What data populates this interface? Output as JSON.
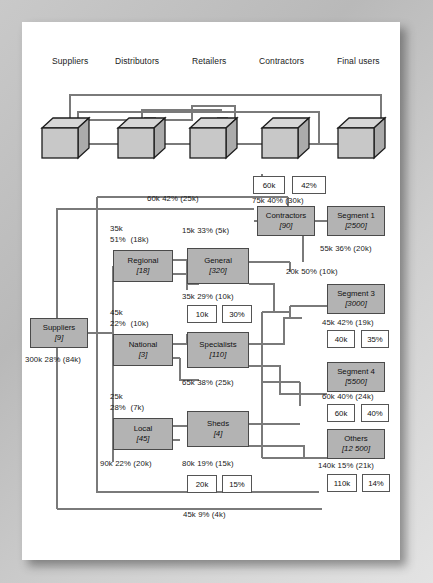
{
  "diagram": {
    "colors": {
      "node_fill": "#b3b3b3",
      "node_stroke": "#4a4a4a",
      "line": "#7a7a7a",
      "page_bg": "#ffffff",
      "outer_bg": "#c4c4c4"
    },
    "chain_labels": [
      {
        "id": "suppliers",
        "text": "Suppliers",
        "x": 52,
        "y": 56
      },
      {
        "id": "distributors",
        "text": "Distributors",
        "x": 115,
        "y": 56
      },
      {
        "id": "retailers",
        "text": "Retailers",
        "x": 192,
        "y": 56
      },
      {
        "id": "contractors",
        "text": "Contractors",
        "x": 259,
        "y": 56
      },
      {
        "id": "final-users",
        "text": "Final users",
        "x": 337,
        "y": 56
      }
    ],
    "cubes": [
      {
        "id": "cube-suppliers",
        "x": 42,
        "y": 118
      },
      {
        "id": "cube-distributors",
        "x": 118,
        "y": 118
      },
      {
        "id": "cube-retailers",
        "x": 190,
        "y": 118
      },
      {
        "id": "cube-contractors",
        "x": 262,
        "y": 118
      },
      {
        "id": "cube-final-users",
        "x": 338,
        "y": 118
      }
    ],
    "nodes": [
      {
        "id": "suppliers",
        "label": "Suppliers",
        "value": "[9]",
        "x": 30,
        "y": 318,
        "w": 58,
        "h": 30
      },
      {
        "id": "regional",
        "label": "Regional",
        "value": "[18]",
        "x": 113,
        "y": 250,
        "w": 60,
        "h": 32
      },
      {
        "id": "national",
        "label": "National",
        "value": "[3]",
        "x": 113,
        "y": 334,
        "w": 60,
        "h": 32
      },
      {
        "id": "local",
        "label": "Local",
        "value": "[45]",
        "x": 113,
        "y": 418,
        "w": 60,
        "h": 32
      },
      {
        "id": "general",
        "label": "General",
        "value": "[320]",
        "x": 187,
        "y": 248,
        "w": 62,
        "h": 36
      },
      {
        "id": "specialists",
        "label": "Specialists",
        "value": "[110]",
        "x": 187,
        "y": 332,
        "w": 62,
        "h": 36
      },
      {
        "id": "sheds",
        "label": "Sheds",
        "value": "[4]",
        "x": 187,
        "y": 411,
        "w": 62,
        "h": 36
      },
      {
        "id": "contractors",
        "label": "Contractors",
        "value": "[90]",
        "x": 257,
        "y": 206,
        "w": 58,
        "h": 30
      },
      {
        "id": "segment-1",
        "label": "Segment 1",
        "value": "[2500]",
        "x": 327,
        "y": 206,
        "w": 58,
        "h": 30
      },
      {
        "id": "segment-3",
        "label": "Segment 3",
        "value": "[3000]",
        "x": 327,
        "y": 284,
        "w": 58,
        "h": 30
      },
      {
        "id": "segment-4",
        "label": "Segment 4",
        "value": "[5500]",
        "x": 327,
        "y": 362,
        "w": 58,
        "h": 30
      },
      {
        "id": "others",
        "label": "Others",
        "value": "[12 500]",
        "x": 327,
        "y": 429,
        "w": 58,
        "h": 30
      }
    ],
    "value_boxes": [
      {
        "id": "vb-top-1",
        "text": "60k",
        "x": 253,
        "y": 176,
        "w": 32,
        "h": 18
      },
      {
        "id": "vb-top-2",
        "text": "42%",
        "x": 292,
        "y": 176,
        "w": 34,
        "h": 18
      },
      {
        "id": "vb-general-1",
        "text": "10k",
        "x": 187,
        "y": 305,
        "w": 30,
        "h": 18
      },
      {
        "id": "vb-general-2",
        "text": "30%",
        "x": 222,
        "y": 305,
        "w": 30,
        "h": 18
      },
      {
        "id": "vb-segment3-1",
        "text": "40k",
        "x": 327,
        "y": 330,
        "w": 28,
        "h": 18
      },
      {
        "id": "vb-segment3-2",
        "text": "35%",
        "x": 361,
        "y": 330,
        "w": 28,
        "h": 18
      },
      {
        "id": "vb-segment4-1",
        "text": "60k",
        "x": 327,
        "y": 404,
        "w": 28,
        "h": 18
      },
      {
        "id": "vb-segment4-2",
        "text": "40%",
        "x": 361,
        "y": 404,
        "w": 28,
        "h": 18
      },
      {
        "id": "vb-others-1",
        "text": "110k",
        "x": 327,
        "y": 474,
        "w": 30,
        "h": 18
      },
      {
        "id": "vb-others-2",
        "text": "14%",
        "x": 362,
        "y": 474,
        "w": 28,
        "h": 18
      },
      {
        "id": "vb-sheds-1",
        "text": "20k",
        "x": 187,
        "y": 475,
        "w": 30,
        "h": 18
      },
      {
        "id": "vb-sheds-2",
        "text": "15%",
        "x": 222,
        "y": 475,
        "w": 30,
        "h": 18
      }
    ],
    "annotations": [
      {
        "id": "ann-60k-42",
        "text": "60k 42% (25k)",
        "x": 147,
        "y": 194,
        "multi": false
      },
      {
        "id": "ann-75k-40",
        "text": "75k 40% (30k)",
        "x": 252,
        "y": 196,
        "multi": false
      },
      {
        "id": "ann-15k-33",
        "text": "15k 33% (5k)",
        "x": 182,
        "y": 226,
        "multi": false
      },
      {
        "id": "ann-35k-51",
        "text": "35k\n51%  (18k)",
        "x": 110,
        "y": 224,
        "multi": true
      },
      {
        "id": "ann-55k-36",
        "text": "55k 36% (20k)",
        "x": 320,
        "y": 244,
        "multi": false
      },
      {
        "id": "ann-20k-50",
        "text": "20k 50% (10k)",
        "x": 286,
        "y": 267,
        "multi": false
      },
      {
        "id": "ann-35k-29",
        "text": "35k 29% (10k)",
        "x": 182,
        "y": 292,
        "multi": false
      },
      {
        "id": "ann-45k-22",
        "text": "45k\n22%  (10k)",
        "x": 110,
        "y": 308,
        "multi": true
      },
      {
        "id": "ann-300k-28",
        "text": "300k 28% (84k)",
        "x": 25,
        "y": 355,
        "multi": false
      },
      {
        "id": "ann-45k-42",
        "text": "45k 42% (19k)",
        "x": 322,
        "y": 318,
        "multi": false
      },
      {
        "id": "ann-65k-38",
        "text": "65k 38% (25k)",
        "x": 182,
        "y": 378,
        "multi": false
      },
      {
        "id": "ann-60k-40",
        "text": "60k 40% (24k)",
        "x": 322,
        "y": 392,
        "multi": false
      },
      {
        "id": "ann-25k-28",
        "text": "25k\n28%  (7k)",
        "x": 110,
        "y": 392,
        "multi": true
      },
      {
        "id": "ann-140k-15",
        "text": "140k 15% (21k)",
        "x": 318,
        "y": 461,
        "multi": false
      },
      {
        "id": "ann-90k-22",
        "text": "90k 22% (20k)",
        "x": 100,
        "y": 459,
        "multi": false
      },
      {
        "id": "ann-80k-19",
        "text": "80k 19% (15k)",
        "x": 182,
        "y": 459,
        "multi": false
      },
      {
        "id": "ann-45k-9",
        "text": "45k 9% (4k)",
        "x": 183,
        "y": 510,
        "multi": false
      }
    ]
  }
}
